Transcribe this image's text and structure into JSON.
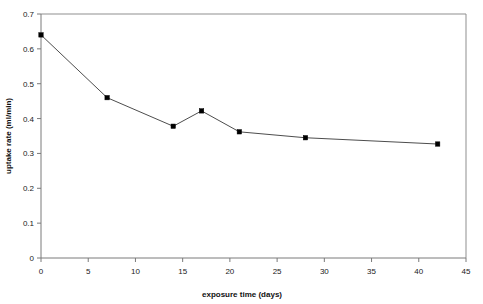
{
  "chart_data": {
    "type": "line",
    "title": "",
    "subtitle": "",
    "xlabel": "exposure time (days)",
    "ylabel": "uptake rate (ml/min)",
    "xlim": [
      0,
      45
    ],
    "ylim": [
      0,
      0.7
    ],
    "grid": false,
    "legend": null,
    "legend_position": "none",
    "x_ticks": [
      0,
      5,
      10,
      15,
      20,
      25,
      30,
      35,
      40,
      45
    ],
    "x_tick_labels": [
      "0",
      "5",
      "10",
      "15",
      "20",
      "25",
      "30",
      "35",
      "40",
      "45"
    ],
    "y_ticks": [
      0,
      0.1,
      0.2,
      0.3,
      0.4,
      0.5,
      0.6,
      0.7
    ],
    "y_tick_labels": [
      "0",
      "0.1",
      "0.2",
      "0.3",
      "0.4",
      "0.5",
      "0.6",
      "0.7"
    ],
    "x": [
      0,
      7,
      14,
      17,
      21,
      28,
      42
    ],
    "values": [
      0.64,
      0.46,
      0.378,
      0.422,
      0.362,
      0.345,
      0.327
    ],
    "series": [
      {
        "name": "uptake rate",
        "x": [
          0,
          7,
          14,
          17,
          21,
          28,
          42
        ],
        "values": [
          0.64,
          0.46,
          0.378,
          0.422,
          0.362,
          0.345,
          0.327
        ],
        "marker": "square",
        "color": "#000000",
        "line_color": "#4d4d4d"
      }
    ],
    "colors": {
      "line": "#4d4d4d",
      "marker": "#000000",
      "axis": "#7a7a7a",
      "frame": "#8f8f8f",
      "text": "#1a1a1a",
      "background": "#ffffff"
    }
  }
}
